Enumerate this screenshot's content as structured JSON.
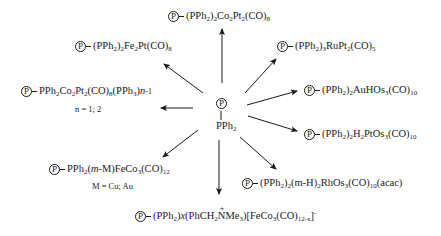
{
  "diagram": {
    "type": "reaction-scheme",
    "center": {
      "support_label": "P",
      "group_label": "PPh2",
      "group_parts": [
        {
          "t": "PPh"
        },
        {
          "sub": "2"
        }
      ]
    },
    "products": [
      {
        "id": "top",
        "support_label": "P",
        "formula": "(PPh2)2Co2Pt2(CO)8",
        "parts": [
          {
            "t": "(PPh"
          },
          {
            "sub": "2"
          },
          {
            "t": ")"
          },
          {
            "sub": "2"
          },
          {
            "t": "Co"
          },
          {
            "sub": "2"
          },
          {
            "t": "Pt"
          },
          {
            "sub": "2"
          },
          {
            "t": "(CO)"
          },
          {
            "sub": "8"
          }
        ]
      },
      {
        "id": "upper-left",
        "support_label": "P",
        "formula": "(PPh2)2Fe2Pt(CO)8",
        "parts": [
          {
            "t": "(PPh"
          },
          {
            "sub": "2"
          },
          {
            "t": ")"
          },
          {
            "sub": "2"
          },
          {
            "t": "Fe"
          },
          {
            "sub": "2"
          },
          {
            "t": "Pt(CO)"
          },
          {
            "sub": "8"
          }
        ]
      },
      {
        "id": "left",
        "support_label": "P",
        "formula": "PPh2Co2Pt2(CO)8(PPh3)n-1",
        "parts": [
          {
            "t": "PPh"
          },
          {
            "sub": "2"
          },
          {
            "t": "Co"
          },
          {
            "sub": "2"
          },
          {
            "t": "Pt"
          },
          {
            "sub": "2"
          },
          {
            "t": "(CO)"
          },
          {
            "sub": "8"
          },
          {
            "t": "(PPh"
          },
          {
            "sub": "3"
          },
          {
            "t": ")"
          },
          {
            "ital": "n"
          },
          {
            "t": "-1",
            "small": true
          }
        ],
        "note": "n = 1; 2"
      },
      {
        "id": "lower-left",
        "support_label": "P",
        "formula": "PPh2(m-M)FeCo3(CO)12",
        "parts": [
          {
            "t": "PPh"
          },
          {
            "sub": "2"
          },
          {
            "t": "("
          },
          {
            "ital": "m"
          },
          {
            "t": "-M)FeCo"
          },
          {
            "sub": "3"
          },
          {
            "t": "(CO)"
          },
          {
            "sub": "12"
          }
        ],
        "note": "M = Cu; Au"
      },
      {
        "id": "bottom",
        "support_label": "P",
        "formula": "(PPh2)x(PhCH2N+Me3)[FeCo3(CO)12-x]-",
        "parts": [
          {
            "t": "(PPh"
          },
          {
            "sub": "2"
          },
          {
            "t": ")"
          },
          {
            "ital": "x"
          },
          {
            "t": "(PhCH"
          },
          {
            "sub": "2"
          },
          {
            "nplus": "N"
          },
          {
            "t": "Me"
          },
          {
            "sub": "3"
          },
          {
            "t": ")[FeCo"
          },
          {
            "sub": "3"
          },
          {
            "t": "(CO)"
          },
          {
            "sub": "12-x"
          },
          {
            "t": "]"
          },
          {
            "sup": "-"
          }
        ]
      },
      {
        "id": "upper-right",
        "support_label": "P",
        "formula": "(PPh2)3RuPt2(CO)5",
        "parts": [
          {
            "t": "(PPh"
          },
          {
            "sub": "2"
          },
          {
            "t": ")"
          },
          {
            "sub": "3"
          },
          {
            "t": "RuPt"
          },
          {
            "sub": "2"
          },
          {
            "t": "(CO)"
          },
          {
            "sub": "5"
          }
        ]
      },
      {
        "id": "right-upper",
        "support_label": "P",
        "formula": "(PPh2)2AuHOs3(CO)10",
        "parts": [
          {
            "t": "(PPh"
          },
          {
            "sub": "2"
          },
          {
            "t": ")"
          },
          {
            "sub": "2"
          },
          {
            "t": "AuHOs"
          },
          {
            "sub": "3"
          },
          {
            "t": "(CO)"
          },
          {
            "sub": "10"
          }
        ]
      },
      {
        "id": "right-lower",
        "support_label": "P",
        "formula": "(PPh2)2H2PtOs3(CO)10",
        "parts": [
          {
            "t": "(PPh"
          },
          {
            "sub": "2"
          },
          {
            "t": ")"
          },
          {
            "sub": "2"
          },
          {
            "t": "H"
          },
          {
            "sub": "2"
          },
          {
            "t": "PtOs"
          },
          {
            "sub": "3"
          },
          {
            "t": "(CO)"
          },
          {
            "sub": "10"
          }
        ]
      },
      {
        "id": "lower-right",
        "support_label": "P",
        "formula": "(PPh2)2(m-H)2RhOs3(CO)10(acac)",
        "parts": [
          {
            "t": "(PPh"
          },
          {
            "sub": "2"
          },
          {
            "t": ")"
          },
          {
            "sub": "2"
          },
          {
            "t": "(m-H)"
          },
          {
            "sub": "2"
          },
          {
            "t": "RhOs"
          },
          {
            "sub": "3"
          },
          {
            "t": "(CO)"
          },
          {
            "sub": "10"
          },
          {
            "t": "(acac)"
          }
        ]
      }
    ],
    "arrows": [
      {
        "to": "top",
        "x1": 222,
        "y1": 83,
        "x2": 222,
        "y2": 29
      },
      {
        "to": "upper-left",
        "x1": 203,
        "y1": 93,
        "x2": 164,
        "y2": 64
      },
      {
        "to": "left",
        "x1": 193,
        "y1": 108,
        "x2": 161,
        "y2": 108
      },
      {
        "to": "lower-left",
        "x1": 198,
        "y1": 130,
        "x2": 163,
        "y2": 157
      },
      {
        "to": "bottom",
        "x1": 219,
        "y1": 140,
        "x2": 219,
        "y2": 194
      },
      {
        "to": "lower-right",
        "x1": 240,
        "y1": 137,
        "x2": 276,
        "y2": 169
      },
      {
        "to": "right-lower",
        "x1": 248,
        "y1": 116,
        "x2": 297,
        "y2": 131
      },
      {
        "to": "right-upper",
        "x1": 247,
        "y1": 105,
        "x2": 297,
        "y2": 91
      },
      {
        "to": "upper-right",
        "x1": 245,
        "y1": 93,
        "x2": 276,
        "y2": 59
      }
    ],
    "colors": {
      "ink": "#1a1a1a",
      "background": "#ffffff"
    }
  }
}
